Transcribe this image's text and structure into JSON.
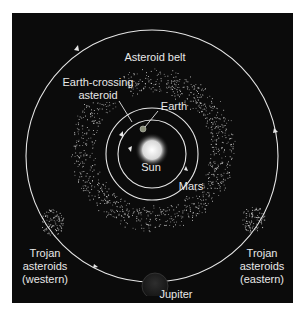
{
  "diagram": {
    "labels": {
      "asteroid_belt": "Asteroid belt",
      "earth_crossing_1": "Earth-crossing",
      "earth_crossing_2": "asteroid",
      "earth": "Earth",
      "sun": "Sun",
      "mars": "Mars",
      "trojan_west_1": "Trojan",
      "trojan_west_2": "asteroids",
      "trojan_west_3": "(western)",
      "trojan_east_1": "Trojan",
      "trojan_east_2": "asteroids",
      "trojan_east_3": "(eastern)",
      "jupiter": "Jupiter"
    },
    "colors": {
      "background": "#0b0b0b",
      "orbit": "#e6e6e6",
      "text": "#e8e8e8",
      "sun": "#f2f2f2",
      "earth": "#8a8f7a",
      "jupiter": "#222222"
    }
  }
}
